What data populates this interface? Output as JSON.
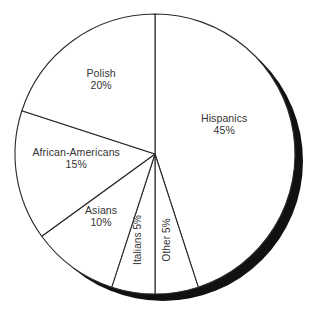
{
  "chart_data": {
    "type": "pie",
    "title": "",
    "xlabel": "",
    "ylabel": "",
    "legend": "none",
    "grid": false,
    "start_angle_deg": 90,
    "direction": "clockwise",
    "categories": [
      "Hispanics",
      "Other",
      "Italians",
      "Asians",
      "African-Americans",
      "Polish"
    ],
    "values": [
      45,
      5,
      5,
      10,
      15,
      20
    ],
    "unit": "%",
    "slices": [
      {
        "name": "Hispanics",
        "value": 45,
        "value_text": "45%",
        "label_text": "Hispanics",
        "start_deg": 0,
        "sweep_deg": 162,
        "orientation": "horizontal",
        "label_x": 224,
        "label_y": 124,
        "fill": "#ffffff",
        "stroke": "#2a2a2a"
      },
      {
        "name": "Other",
        "value": 5,
        "value_text": "Other 5%",
        "label_text": "Other 5%",
        "start_deg": 162,
        "sweep_deg": 18,
        "orientation": "vertical",
        "label_x": 166,
        "label_y": 240,
        "fill": "#ffffff",
        "stroke": "#2a2a2a"
      },
      {
        "name": "Italians",
        "value": 5,
        "value_text": "Italians 5%",
        "label_text": "Italians 5%",
        "start_deg": 180,
        "sweep_deg": 18,
        "orientation": "vertical",
        "label_x": 138,
        "label_y": 240,
        "fill": "#ffffff",
        "stroke": "#2a2a2a"
      },
      {
        "name": "Asians",
        "value": 10,
        "value_text": "10%",
        "label_text": "Asians",
        "start_deg": 198,
        "sweep_deg": 36,
        "orientation": "horizontal",
        "label_x": 101,
        "label_y": 216,
        "fill": "#ffffff",
        "stroke": "#2a2a2a"
      },
      {
        "name": "African-Americans",
        "value": 15,
        "value_text": "15%",
        "label_text": "African-Americans",
        "start_deg": 234,
        "sweep_deg": 54,
        "orientation": "horizontal",
        "label_x": 76,
        "label_y": 158,
        "fill": "#ffffff",
        "stroke": "#2a2a2a"
      },
      {
        "name": "Polish",
        "value": 20,
        "value_text": "20%",
        "label_text": "Polish",
        "start_deg": 288,
        "sweep_deg": 72,
        "orientation": "horizontal",
        "label_x": 101,
        "label_y": 79,
        "fill": "#ffffff",
        "stroke": "#2a2a2a"
      }
    ],
    "geometry": {
      "center_x": 155,
      "center_y": 154,
      "radius": 140,
      "shadow_offset_x": 8,
      "shadow_offset_y": 7
    },
    "colors": {
      "slice_fill": "#ffffff",
      "slice_stroke": "#2a2a2a",
      "shadow": "#111111",
      "label_text": "#333333",
      "background": "#ffffff"
    }
  },
  "top_artifact": {
    "text": "·"
  }
}
